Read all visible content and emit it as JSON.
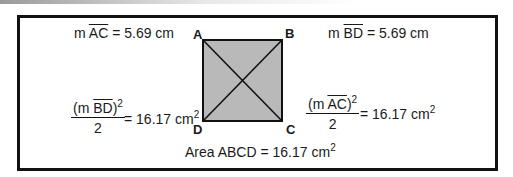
{
  "measurements": {
    "ac": {
      "prefix": "m",
      "segment": "AC",
      "value": "= 5.69 cm"
    },
    "bd": {
      "prefix": "m",
      "segment": "BD",
      "value": "= 5.69 cm"
    }
  },
  "vertices": {
    "a": "A",
    "b": "B",
    "c": "C",
    "d": "D"
  },
  "formulas": {
    "left": {
      "open": "(m",
      "segment": "BD",
      "close": ")",
      "exp": "2",
      "denominator": "2",
      "result": "= 16.17 cm",
      "unit_exp": "2"
    },
    "right": {
      "open": "(m",
      "segment": "AC",
      "close": ")",
      "exp": "2",
      "denominator": "2",
      "result": "= 16.17 cm",
      "unit_exp": "2"
    }
  },
  "area": {
    "label": "Area ABCD = 16.17 cm",
    "unit_exp": "2"
  },
  "colors": {
    "square_fill": "#b9b9b9",
    "stroke": "#111111"
  }
}
